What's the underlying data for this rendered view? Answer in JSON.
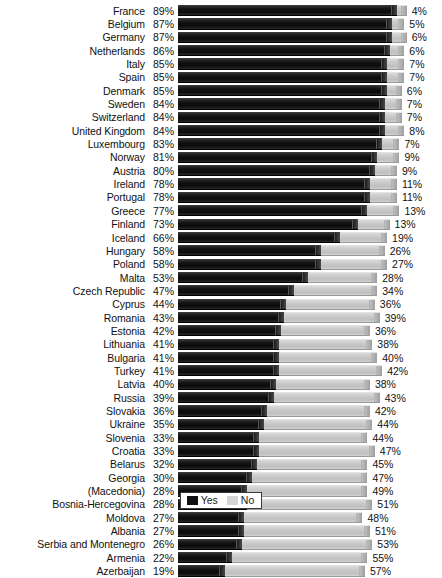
{
  "chart_data": {
    "type": "bar",
    "subtype": "horizontal-stacked",
    "title": "",
    "xlabel": "",
    "ylabel": "",
    "xlim": [
      0,
      100
    ],
    "grid": false,
    "legend_position": "bottom",
    "legend": [
      "Yes",
      "No"
    ],
    "colors": {
      "yes": "#111111",
      "no": "#d5d5d5",
      "background": "#ffffff",
      "text": "#111111"
    },
    "categories": [
      "France",
      "Belgium",
      "Germany",
      "Netherlands",
      "Italy",
      "Spain",
      "Denmark",
      "Sweden",
      "Switzerland",
      "United Kingdom",
      "Luxembourg",
      "Norway",
      "Austria",
      "Ireland",
      "Portugal",
      "Greece",
      "Finland",
      "Iceland",
      "Hungary",
      "Poland",
      "Malta",
      "Czech Republic",
      "Cyprus",
      "Romania",
      "Estonia",
      "Lithuania",
      "Bulgaria",
      "Turkey",
      "Latvia",
      "Russia",
      "Slovakia",
      "Ukraine",
      "Slovenia",
      "Croatia",
      "Belarus",
      "Georgia",
      "(Macedonia)",
      "Bosnia-Hercegovina",
      "Moldova",
      "Albania",
      "Serbia and Montenegro",
      "Armenia",
      "Azerbaijan"
    ],
    "series": [
      {
        "name": "Yes",
        "values": [
          89,
          87,
          87,
          86,
          85,
          85,
          85,
          84,
          84,
          84,
          83,
          81,
          80,
          78,
          78,
          77,
          73,
          66,
          58,
          58,
          53,
          47,
          44,
          43,
          42,
          41,
          41,
          41,
          40,
          39,
          36,
          35,
          33,
          33,
          32,
          30,
          28,
          28,
          27,
          27,
          26,
          22,
          19
        ]
      },
      {
        "name": "No",
        "values": [
          4,
          5,
          6,
          6,
          7,
          7,
          6,
          7,
          7,
          8,
          7,
          9,
          9,
          11,
          11,
          13,
          13,
          19,
          26,
          27,
          28,
          34,
          36,
          39,
          36,
          38,
          40,
          42,
          38,
          43,
          42,
          44,
          44,
          47,
          45,
          47,
          49,
          51,
          48,
          51,
          53,
          55,
          57
        ]
      }
    ]
  },
  "rows": [
    {
      "category": "France",
      "yes": "89%",
      "no": "4%",
      "yes_val": 89,
      "no_val": 4
    },
    {
      "category": "Belgium",
      "yes": "87%",
      "no": "5%",
      "yes_val": 87,
      "no_val": 5
    },
    {
      "category": "Germany",
      "yes": "87%",
      "no": "6%",
      "yes_val": 87,
      "no_val": 6
    },
    {
      "category": "Netherlands",
      "yes": "86%",
      "no": "6%",
      "yes_val": 86,
      "no_val": 6
    },
    {
      "category": "Italy",
      "yes": "85%",
      "no": "7%",
      "yes_val": 85,
      "no_val": 7
    },
    {
      "category": "Spain",
      "yes": "85%",
      "no": "7%",
      "yes_val": 85,
      "no_val": 7
    },
    {
      "category": "Denmark",
      "yes": "85%",
      "no": "6%",
      "yes_val": 85,
      "no_val": 6
    },
    {
      "category": "Sweden",
      "yes": "84%",
      "no": "7%",
      "yes_val": 84,
      "no_val": 7
    },
    {
      "category": "Switzerland",
      "yes": "84%",
      "no": "7%",
      "yes_val": 84,
      "no_val": 7
    },
    {
      "category": "United Kingdom",
      "yes": "84%",
      "no": "8%",
      "yes_val": 84,
      "no_val": 8
    },
    {
      "category": "Luxembourg",
      "yes": "83%",
      "no": "7%",
      "yes_val": 83,
      "no_val": 7
    },
    {
      "category": "Norway",
      "yes": "81%",
      "no": "9%",
      "yes_val": 81,
      "no_val": 9
    },
    {
      "category": "Austria",
      "yes": "80%",
      "no": "9%",
      "yes_val": 80,
      "no_val": 9
    },
    {
      "category": "Ireland",
      "yes": "78%",
      "no": "11%",
      "yes_val": 78,
      "no_val": 11
    },
    {
      "category": "Portugal",
      "yes": "78%",
      "no": "11%",
      "yes_val": 78,
      "no_val": 11
    },
    {
      "category": "Greece",
      "yes": "77%",
      "no": "13%",
      "yes_val": 77,
      "no_val": 13
    },
    {
      "category": "Finland",
      "yes": "73%",
      "no": "13%",
      "yes_val": 73,
      "no_val": 13
    },
    {
      "category": "Iceland",
      "yes": "66%",
      "no": "19%",
      "yes_val": 66,
      "no_val": 19
    },
    {
      "category": "Hungary",
      "yes": "58%",
      "no": "26%",
      "yes_val": 58,
      "no_val": 26
    },
    {
      "category": "Poland",
      "yes": "58%",
      "no": "27%",
      "yes_val": 58,
      "no_val": 27
    },
    {
      "category": "Malta",
      "yes": "53%",
      "no": "28%",
      "yes_val": 53,
      "no_val": 28
    },
    {
      "category": "Czech Republic",
      "yes": "47%",
      "no": "34%",
      "yes_val": 47,
      "no_val": 34
    },
    {
      "category": "Cyprus",
      "yes": "44%",
      "no": "36%",
      "yes_val": 44,
      "no_val": 36
    },
    {
      "category": "Romania",
      "yes": "43%",
      "no": "39%",
      "yes_val": 43,
      "no_val": 39
    },
    {
      "category": "Estonia",
      "yes": "42%",
      "no": "36%",
      "yes_val": 42,
      "no_val": 36
    },
    {
      "category": "Lithuania",
      "yes": "41%",
      "no": "38%",
      "yes_val": 41,
      "no_val": 38
    },
    {
      "category": "Bulgaria",
      "yes": "41%",
      "no": "40%",
      "yes_val": 41,
      "no_val": 40
    },
    {
      "category": "Turkey",
      "yes": "41%",
      "no": "42%",
      "yes_val": 41,
      "no_val": 42
    },
    {
      "category": "Latvia",
      "yes": "40%",
      "no": "38%",
      "yes_val": 40,
      "no_val": 38
    },
    {
      "category": "Russia",
      "yes": "39%",
      "no": "43%",
      "yes_val": 39,
      "no_val": 43
    },
    {
      "category": "Slovakia",
      "yes": "36%",
      "no": "42%",
      "yes_val": 36,
      "no_val": 42
    },
    {
      "category": "Ukraine",
      "yes": "35%",
      "no": "44%",
      "yes_val": 35,
      "no_val": 44
    },
    {
      "category": "Slovenia",
      "yes": "33%",
      "no": "44%",
      "yes_val": 33,
      "no_val": 44
    },
    {
      "category": "Croatia",
      "yes": "33%",
      "no": "47%",
      "yes_val": 33,
      "no_val": 47
    },
    {
      "category": "Belarus",
      "yes": "32%",
      "no": "45%",
      "yes_val": 32,
      "no_val": 45
    },
    {
      "category": "Georgia",
      "yes": "30%",
      "no": "47%",
      "yes_val": 30,
      "no_val": 47
    },
    {
      "category": "(Macedonia)",
      "yes": "28%",
      "no": "49%",
      "yes_val": 28,
      "no_val": 49
    },
    {
      "category": "Bosnia-Hercegovina",
      "yes": "28%",
      "no": "51%",
      "yes_val": 28,
      "no_val": 51
    },
    {
      "category": "Moldova",
      "yes": "27%",
      "no": "48%",
      "yes_val": 27,
      "no_val": 48
    },
    {
      "category": "Albania",
      "yes": "27%",
      "no": "51%",
      "yes_val": 27,
      "no_val": 51
    },
    {
      "category": "Serbia and Montenegro",
      "yes": "26%",
      "no": "53%",
      "yes_val": 26,
      "no_val": 53
    },
    {
      "category": "Armenia",
      "yes": "22%",
      "no": "55%",
      "yes_val": 22,
      "no_val": 55
    },
    {
      "category": "Azerbaijan",
      "yes": "19%",
      "no": "57%",
      "yes_val": 19,
      "no_val": 57
    }
  ],
  "legend": {
    "yes_label": "Yes",
    "no_label": "No"
  }
}
